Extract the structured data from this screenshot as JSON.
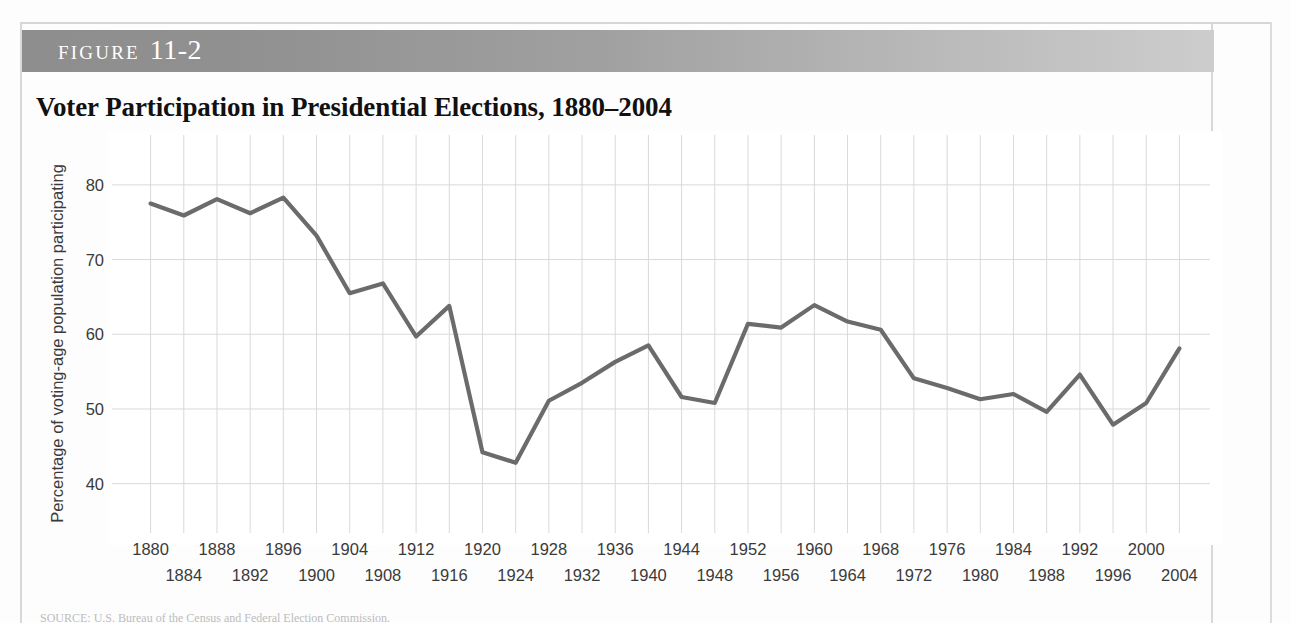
{
  "figure": {
    "band_label": "Figure",
    "number": "11-2",
    "title": "Voter Participation in Presidential Elections, 1880–2004"
  },
  "source_note": "SOURCE: U.S. Bureau of the Census and Federal Election Commission.",
  "colors": {
    "line": "#6b6b6b",
    "grid": "#d9d9d9",
    "band_dark": "#8e8e8e",
    "band_light": "#cdcdcd",
    "text": "#3a3a3a"
  },
  "chart_data": {
    "type": "line",
    "title": "Voter Participation in Presidential Elections, 1880–2004",
    "xlabel": "",
    "ylabel": "Percentage of voting-age population participating",
    "xlim": [
      1878,
      2006
    ],
    "ylim": [
      35,
      84
    ],
    "yticks": [
      40,
      50,
      60,
      70,
      80
    ],
    "xticks_top": [
      1880,
      1888,
      1896,
      1904,
      1912,
      1920,
      1928,
      1936,
      1944,
      1952,
      1960,
      1968,
      1976,
      1984,
      1992,
      2000
    ],
    "xticks_bottom": [
      1884,
      1892,
      1900,
      1908,
      1916,
      1924,
      1932,
      1940,
      1948,
      1956,
      1964,
      1972,
      1980,
      1988,
      1996,
      2004
    ],
    "grid": true,
    "legend": "none",
    "x": [
      1880,
      1884,
      1888,
      1892,
      1896,
      1900,
      1904,
      1908,
      1912,
      1916,
      1920,
      1924,
      1928,
      1932,
      1936,
      1940,
      1944,
      1948,
      1952,
      1956,
      1960,
      1964,
      1968,
      1972,
      1976,
      1980,
      1984,
      1988,
      1992,
      1996,
      2000,
      2004
    ],
    "values": [
      77.5,
      75.9,
      78.1,
      76.2,
      78.3,
      73.2,
      65.5,
      66.8,
      59.7,
      63.8,
      44.2,
      42.8,
      51.1,
      53.5,
      56.3,
      58.5,
      51.6,
      50.8,
      61.4,
      60.9,
      63.9,
      61.7,
      60.6,
      54.1,
      52.8,
      51.3,
      52.0,
      49.6,
      54.6,
      47.9,
      50.8,
      58.1
    ]
  }
}
